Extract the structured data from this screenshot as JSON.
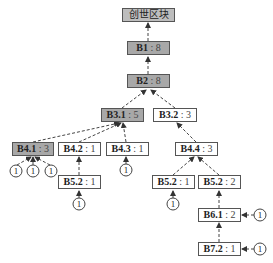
{
  "diagram": {
    "type": "blockchain-fork-tree",
    "genesis": {
      "label": "创世区块"
    },
    "nodes": [
      {
        "key": "b1",
        "id": "B1",
        "weight": "8"
      },
      {
        "key": "b2",
        "id": "B2",
        "weight": "8"
      },
      {
        "key": "b31",
        "id": "B3.1",
        "weight": "5"
      },
      {
        "key": "b32",
        "id": "B3.2",
        "weight": "3"
      },
      {
        "key": "b41",
        "id": "B4.1",
        "weight": "3"
      },
      {
        "key": "b42",
        "id": "B4.2",
        "weight": "1"
      },
      {
        "key": "b43",
        "id": "B4.3",
        "weight": "1"
      },
      {
        "key": "b44",
        "id": "B4.4",
        "weight": "3"
      },
      {
        "key": "b52a",
        "id": "B5.2",
        "weight": "1"
      },
      {
        "key": "b52b",
        "id": "B5.2",
        "weight": "1"
      },
      {
        "key": "b52c",
        "id": "B5.2",
        "weight": "2"
      },
      {
        "key": "b61",
        "id": "B6.1",
        "weight": "2"
      },
      {
        "key": "b72",
        "id": "B7.2",
        "weight": "1"
      }
    ],
    "separator": ":",
    "vote_label": "1",
    "colors": {
      "main_chain_fill": "#a8a8a8",
      "genesis_fill": "#bdbdbd",
      "side_fill": "#ffffff",
      "border": "#555555",
      "edge": "#444444"
    }
  }
}
